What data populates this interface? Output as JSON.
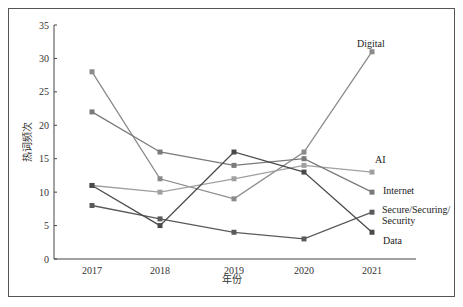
{
  "chart_data": {
    "type": "line",
    "title": "",
    "xlabel": "年份",
    "ylabel": "热词频次",
    "x": [
      "2017",
      "2018",
      "2019",
      "2020",
      "2021"
    ],
    "ylim": [
      0,
      35
    ],
    "yticks": [
      0,
      5,
      10,
      15,
      20,
      25,
      30,
      35
    ],
    "grid": false,
    "legend": "inline labels at right end of each line",
    "series": [
      {
        "name": "Digital",
        "values": [
          28,
          12,
          9,
          16,
          31
        ],
        "color": "#8a8a8a"
      },
      {
        "name": "AI",
        "values": [
          11,
          10,
          12,
          14,
          13
        ],
        "color": "#a0a0a0"
      },
      {
        "name": "Internet",
        "values": [
          22,
          16,
          14,
          15,
          10
        ],
        "color": "#7a7a7a"
      },
      {
        "name": "Secure/Securing/Security",
        "values": [
          8,
          6,
          4,
          3,
          7
        ],
        "color": "#5a5a5a"
      },
      {
        "name": "Data",
        "values": [
          11,
          5,
          16,
          13,
          4
        ],
        "color": "#4a4a4a"
      }
    ]
  },
  "labels": {
    "ylabel": "热词频次",
    "xlabel": "年份",
    "digital": "Digital",
    "ai": "AI",
    "internet": "Internet",
    "secure_line1": "Secure/Securing/",
    "secure_line2": "Security",
    "data": "Data"
  }
}
